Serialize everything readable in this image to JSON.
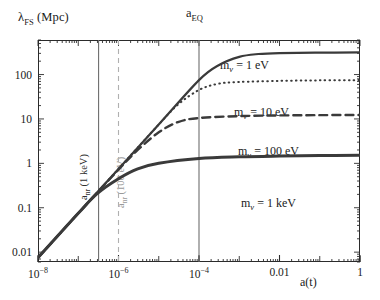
{
  "chart_data": {
    "type": "line",
    "title": "",
    "xlabel": "a(t)",
    "ylabel": "λ_FS (Mpc)",
    "xscale": "log",
    "yscale": "log",
    "xlim": [
      1e-08,
      1
    ],
    "ylim": [
      0.006,
      600
    ],
    "grid": false,
    "legend_position": "inline-right",
    "xtick_labels": [
      "10−8",
      "10−6",
      "10−4",
      "0.01",
      "1"
    ],
    "xtick_values": [
      1e-08,
      1e-06,
      0.0001,
      0.01,
      1
    ],
    "ytick_labels": [
      "100",
      "10",
      "1",
      "0.1",
      "0.01"
    ],
    "ytick_values": [
      100,
      10,
      1,
      0.1,
      0.01
    ],
    "series": [
      {
        "name": "mν = 1 eV",
        "style": "solid",
        "width": 2.2,
        "color": "#3a3a3a",
        "plateau": 300,
        "x": [
          1e-08,
          1e-07,
          1e-06,
          1e-05,
          0.0001,
          0.0003,
          0.001,
          0.003,
          0.01,
          0.1,
          1
        ],
        "y": [
          0.0075,
          0.075,
          0.75,
          7.5,
          75,
          160,
          250,
          290,
          305,
          312,
          315
        ]
      },
      {
        "name": "mν = 10 eV",
        "style": "dotted",
        "width": 2.0,
        "color": "#3a3a3a",
        "plateau": 70,
        "x": [
          1e-08,
          1e-07,
          1e-06,
          1e-05,
          3e-05,
          0.0001,
          0.0003,
          0.001,
          0.01,
          0.1,
          1
        ],
        "y": [
          0.0075,
          0.075,
          0.75,
          7.5,
          21,
          45,
          62,
          68,
          72,
          74,
          75
        ]
      },
      {
        "name": "mν = 100 eV",
        "style": "dashed",
        "width": 2.4,
        "color": "#3a3a3a",
        "plateau": 12,
        "x": [
          1e-08,
          1e-07,
          1e-06,
          3e-06,
          1e-05,
          3e-05,
          0.0001,
          0.001,
          0.01,
          0.1,
          1
        ],
        "y": [
          0.0075,
          0.075,
          0.72,
          2.0,
          5.0,
          8.5,
          10.5,
          11.6,
          12.0,
          12.2,
          12.3
        ]
      },
      {
        "name": "mν = 1 keV",
        "style": "solid",
        "width": 3.0,
        "color": "#3a3a3a",
        "plateau": 1.5,
        "x": [
          1e-08,
          1e-07,
          3e-07,
          1e-06,
          3e-06,
          1e-05,
          0.0001,
          0.001,
          0.01,
          0.1,
          1
        ],
        "y": [
          0.0075,
          0.075,
          0.21,
          0.45,
          0.75,
          1.0,
          1.28,
          1.4,
          1.46,
          1.5,
          1.52
        ]
      }
    ],
    "vlines": [
      {
        "name": "a_nr (1 keV)",
        "x": 3.2e-07,
        "style": "solid",
        "color": "#6e6e6e",
        "label": "a",
        "label_sub": "nr",
        "label_rest": " (1 keV)",
        "label_color": "#3a3a3a"
      },
      {
        "name": "a_nr (100 eV)",
        "x": 1e-06,
        "style": "dashed",
        "color": "#b0b0b0",
        "label": "a",
        "label_sub": "nr",
        "label_rest": " (100 eV)",
        "label_color": "#a0a0a0"
      },
      {
        "name": "a_EQ",
        "x": 0.0001,
        "style": "solid",
        "color": "#6e6e6e",
        "label": "a",
        "label_sub": "EQ",
        "label_rest": "",
        "label_color": "#1a1a1a"
      }
    ]
  },
  "axes": {
    "y_title_main": "λ",
    "y_title_sub": "FS",
    "y_title_unit": " (Mpc)",
    "x_title": "a(t)"
  },
  "labels": {
    "aeq_main": "a",
    "aeq_sub": "EQ",
    "curve1": {
      "m": "m",
      "sub": "ν",
      "eq": " = 1 eV"
    },
    "curve2": {
      "m": "m",
      "sub": "ν",
      "eq": " = 10 eV"
    },
    "curve3": {
      "m": "m",
      "sub": "ν",
      "eq": " = 100 eV"
    },
    "curve4": {
      "m": "m",
      "sub": "ν",
      "eq": " = 1 keV"
    },
    "vline1": {
      "a": "a",
      "sub": "nr",
      "rest": " (1 keV)"
    },
    "vline2": {
      "a": "a",
      "sub": "nr",
      "rest": " (100 eV)"
    }
  },
  "ticks": {
    "y": [
      {
        "label": "100",
        "sup": ""
      },
      {
        "label": "10",
        "sup": ""
      },
      {
        "label": "1",
        "sup": ""
      },
      {
        "label": "0.1",
        "sup": ""
      },
      {
        "label": "0.01",
        "sup": ""
      }
    ],
    "x": [
      {
        "base": "10",
        "sup": "−8"
      },
      {
        "base": "10",
        "sup": "−6"
      },
      {
        "base": "10",
        "sup": "−4"
      },
      {
        "base": "0.01",
        "sup": ""
      },
      {
        "base": "1",
        "sup": ""
      }
    ]
  }
}
